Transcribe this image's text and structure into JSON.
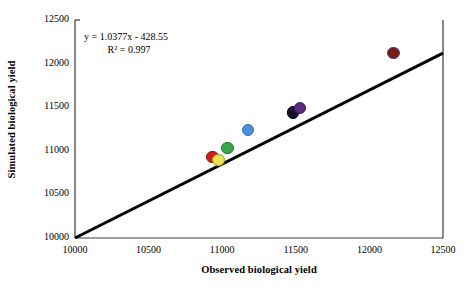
{
  "chart_data": {
    "type": "scatter",
    "title": "",
    "xlabel": "Observed biological yield",
    "ylabel": "Simulated biological yield",
    "xlim": [
      10000,
      12500
    ],
    "ylim": [
      10000,
      12500
    ],
    "xticks": [
      "10000",
      "10500",
      "11000",
      "11500",
      "12000",
      "12500"
    ],
    "yticks": [
      "10000",
      "10500",
      "11000",
      "11500",
      "12000",
      "12500"
    ],
    "grid": false,
    "legend": "none",
    "annotations": {
      "equation": "y = 1.0377x - 428.55",
      "r_squared": "R² = 0.997"
    },
    "reference_line": {
      "name": "1:1 line",
      "from": [
        10000,
        10000
      ],
      "to": [
        12500,
        12500
      ],
      "color": "#000000"
    },
    "points": [
      {
        "name": "point-red",
        "x": 10935,
        "y": 10930,
        "color": "#d01d17",
        "edge": "#7d1410"
      },
      {
        "name": "point-yellow",
        "x": 10975,
        "y": 10895,
        "color": "#e8e352",
        "edge": "#9aa02c"
      },
      {
        "name": "point-green",
        "x": 11035,
        "y": 11030,
        "color": "#3aa94a",
        "edge": "#247a33"
      },
      {
        "name": "point-blue",
        "x": 11175,
        "y": 11235,
        "color": "#4a90d9",
        "edge": "#2f6fb0"
      },
      {
        "name": "point-navy",
        "x": 11480,
        "y": 11440,
        "color": "#151030",
        "edge": "#000000"
      },
      {
        "name": "point-purple",
        "x": 11530,
        "y": 11490,
        "color": "#5b2a83",
        "edge": "#3a1856"
      },
      {
        "name": "point-maroon",
        "x": 12165,
        "y": 12120,
        "color": "#7b1a12",
        "edge": "#2c4f9e"
      }
    ]
  },
  "axes": {
    "x_title": "Observed biological yield",
    "y_title": "Simulated biological yield"
  }
}
